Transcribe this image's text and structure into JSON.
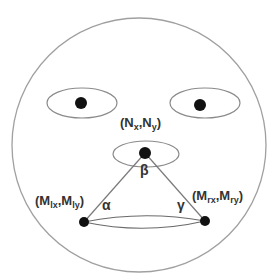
{
  "diagram": {
    "type": "face-landmark-triangle",
    "colors": {
      "outline": "#9a9a9a",
      "line": "#7a7a7a",
      "dot": "#111111",
      "text": "#333333",
      "background": "#ffffff"
    },
    "face": {
      "cx": 139,
      "cy": 145,
      "r": 127
    },
    "eyes": [
      {
        "name": "left-eye",
        "cx": 82,
        "cy": 103,
        "rx": 35,
        "ry": 15,
        "pupil_r": 6
      },
      {
        "name": "right-eye",
        "cx": 205,
        "cy": 103,
        "rx": 35,
        "ry": 15,
        "pupil_r": 6
      }
    ],
    "nose": {
      "cx": 145,
      "cy": 152,
      "rx": 32,
      "ry": 13,
      "point": {
        "x": 145,
        "y": 153,
        "r": 6
      }
    },
    "mouth": {
      "left": {
        "x": 84,
        "y": 222,
        "r": 5
      },
      "right": {
        "x": 205,
        "y": 221,
        "r": 5
      },
      "ellipse": {
        "cx": 144,
        "cy": 222,
        "rx": 62,
        "ry": 8
      }
    },
    "labels": {
      "nose_point": {
        "open": "(N",
        "sub1": "x",
        "mid": ",N",
        "sub2": "y",
        "close": ")"
      },
      "left_mouth": {
        "open": "(M",
        "sub1": "lx",
        "mid": ",M",
        "sub2": "ly",
        "close": ")"
      },
      "right_mouth": {
        "open": "(M",
        "sub1": "rx",
        "mid": ",M",
        "sub2": "ry",
        "close": ")"
      }
    },
    "angles": {
      "alpha": "α",
      "beta": "β",
      "gamma": "γ"
    }
  }
}
